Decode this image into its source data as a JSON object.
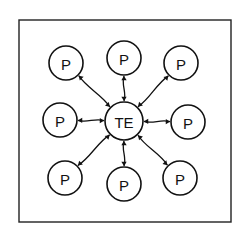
{
  "diagram": {
    "type": "star-network",
    "frame": {
      "x": 19,
      "y": 20,
      "w": 212,
      "h": 202
    },
    "hub": {
      "label": "TE",
      "cx": 124,
      "cy": 121,
      "r": 19
    },
    "peripherals": [
      {
        "label": "P",
        "position": "top-left",
        "cx": 66,
        "cy": 63,
        "r": 17
      },
      {
        "label": "P",
        "position": "top",
        "cx": 124,
        "cy": 58,
        "r": 17
      },
      {
        "label": "P",
        "position": "top-right",
        "cx": 181,
        "cy": 63,
        "r": 17
      },
      {
        "label": "P",
        "position": "left",
        "cx": 60,
        "cy": 120,
        "r": 17
      },
      {
        "label": "P",
        "position": "right",
        "cx": 188,
        "cy": 122,
        "r": 17
      },
      {
        "label": "P",
        "position": "bottom-left",
        "cx": 65,
        "cy": 178,
        "r": 17
      },
      {
        "label": "P",
        "position": "bottom",
        "cx": 124,
        "cy": 184,
        "r": 17
      },
      {
        "label": "P",
        "position": "bottom-right",
        "cx": 180,
        "cy": 178,
        "r": 17
      }
    ],
    "connector_style": "wavy double-headed arrow",
    "colors": {
      "stroke": "#111111",
      "background": "#ffffff"
    }
  }
}
